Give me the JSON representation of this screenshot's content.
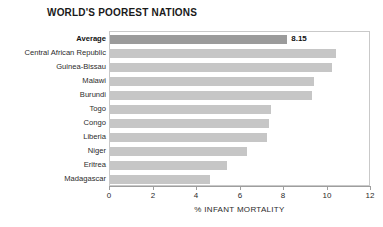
{
  "chart_data": {
    "type": "bar",
    "orientation": "horizontal",
    "title": "WORLD'S POOREST NATIONS",
    "xlabel": "% INFANT MORTALITY",
    "ylabel": "",
    "xlim": [
      0,
      12
    ],
    "xticks": [
      0,
      2,
      4,
      6,
      8,
      10,
      12
    ],
    "xtick_labels": [
      "0",
      "2",
      "4",
      "6",
      "8",
      "10",
      "12"
    ],
    "grid": false,
    "legend": null,
    "categories": [
      "Average",
      "Central African Republic",
      "Guinea-Bissau",
      "Malawi",
      "Burundi",
      "Togo",
      "Congo",
      "Liberia",
      "Niger",
      "Eritrea",
      "Madagascar"
    ],
    "values": [
      8.15,
      10.4,
      10.2,
      9.4,
      9.3,
      7.4,
      7.3,
      7.2,
      6.3,
      5.4,
      4.6
    ],
    "data_labels": [
      "8.15",
      "",
      "",
      "",
      "",
      "",
      "",
      "",
      "",
      "",
      ""
    ],
    "highlight_index": 0,
    "colors": {
      "bar": "#c6c6c6",
      "bar_highlight": "#9b9b9b",
      "axis": "#9e9e9e",
      "frame": "#c9c9c9",
      "text": "#2b2b2b",
      "background": "#ffffff"
    }
  }
}
